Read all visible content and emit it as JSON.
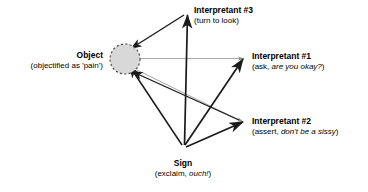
{
  "diagram": {
    "colors": {
      "stroke_primary": "#1a1a1a",
      "stroke_secondary": "#9a9a9a",
      "object_fill": "#d8d8d8",
      "object_border": "#4d4d4d",
      "text": "#000000",
      "background": "#ffffff"
    },
    "nodes": {
      "object": {
        "label": "Object",
        "sublabel": "(objectified as 'pain')",
        "shape": "dashed-circle",
        "cx": 125,
        "cy": 59,
        "r": 15
      },
      "sign": {
        "label": "Sign",
        "sublabel_prefix": "(exclaim, ",
        "sublabel_italic": "ouch!",
        "sublabel_suffix": ")",
        "x": 183,
        "y": 148
      },
      "interpretant1": {
        "label": "Interpretant #1",
        "sublabel_prefix": "(ask, ",
        "sublabel_italic": "are you okay?",
        "sublabel_suffix": ")",
        "x": 243,
        "y": 58
      },
      "interpretant2": {
        "label": "Interpretant #2",
        "sublabel_prefix": "(assert, ",
        "sublabel_italic": "don't be a sissy",
        "sublabel_suffix": ")",
        "x": 243,
        "y": 122
      },
      "interpretant3": {
        "label": "Interpretant #3",
        "sublabel": "(turn to look)",
        "x": 186,
        "y": 12
      }
    },
    "edges": [
      {
        "name": "sign-to-interpretant3",
        "from": "sign",
        "to": "interpretant3",
        "style": "solid-dark",
        "arrow": "end"
      },
      {
        "name": "sign-to-interpretant1",
        "from": "sign",
        "to": "interpretant1",
        "style": "solid-dark",
        "arrow": "end"
      },
      {
        "name": "sign-to-interpretant2",
        "from": "sign",
        "to": "interpretant2",
        "style": "solid-dark",
        "arrow": "end"
      },
      {
        "name": "sign-to-object",
        "from": "sign",
        "to": "object",
        "style": "solid-dark",
        "arrow": "end"
      },
      {
        "name": "interpretant3-to-object",
        "from": "interpretant3",
        "to": "object",
        "style": "solid-dark",
        "arrow": "end"
      },
      {
        "name": "interpretant2-to-object",
        "from": "interpretant2",
        "to": "object",
        "style": "solid-dark",
        "arrow": "end"
      },
      {
        "name": "object-to-interpretant1",
        "from": "object",
        "to": "interpretant1",
        "style": "thin-gray",
        "arrow": "end"
      },
      {
        "name": "object-to-interpretant2",
        "from": "object",
        "to": "interpretant2",
        "style": "thin-gray",
        "arrow": "end"
      }
    ]
  }
}
